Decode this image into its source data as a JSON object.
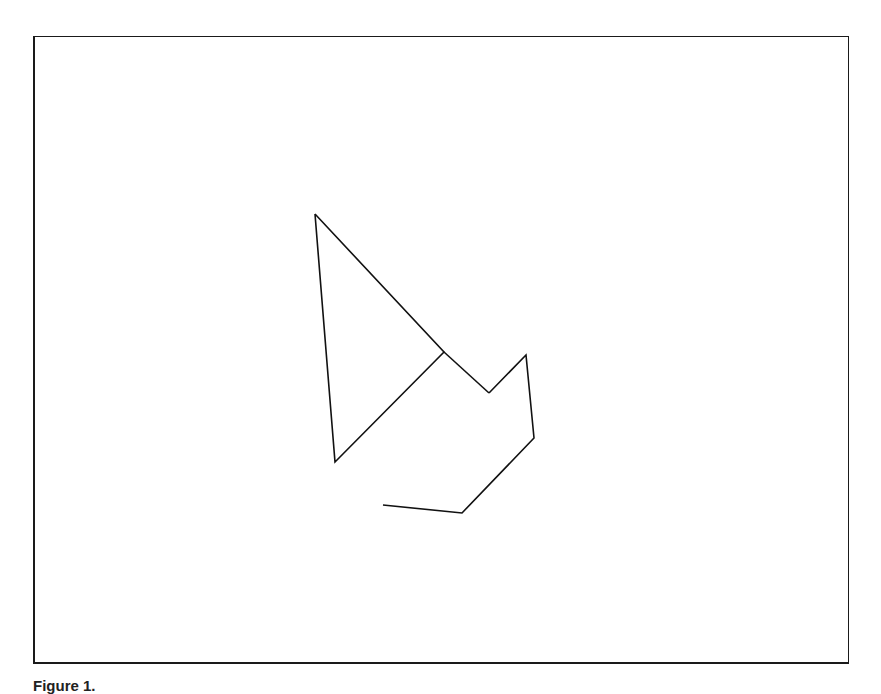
{
  "figure": {
    "caption_label": "Figure 1.",
    "caption_text": "",
    "frame_color": "#1a1a1a",
    "line_color": "#111111"
  },
  "shapes": {
    "triangle": {
      "points": [
        [
          315,
          214
        ],
        [
          335,
          462
        ],
        [
          444,
          352
        ]
      ]
    },
    "sail_edge": {
      "points": [
        [
          444,
          352
        ],
        [
          489,
          393
        ]
      ]
    },
    "parallelogram": {
      "points": [
        [
          489,
          393
        ],
        [
          526,
          355
        ],
        [
          534,
          438
        ],
        [
          462,
          513
        ],
        [
          383,
          505
        ]
      ]
    }
  }
}
